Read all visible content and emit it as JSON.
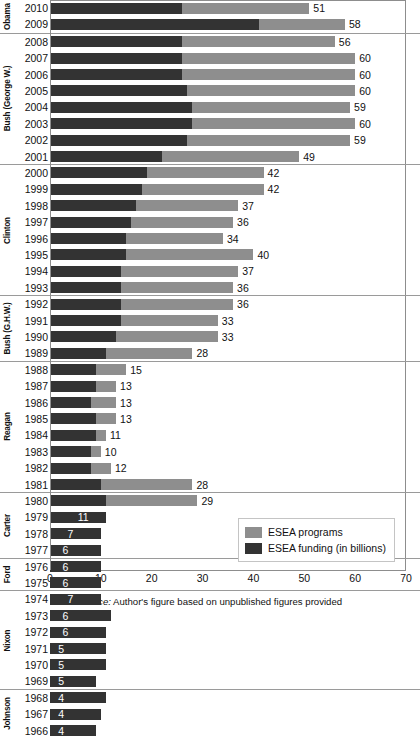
{
  "chart_data": {
    "type": "bar",
    "orientation": "horizontal",
    "stacked_overlay": true,
    "title": "",
    "xlabel": "",
    "ylabel": "",
    "xlim": [
      0,
      70
    ],
    "xticks": [
      0,
      10,
      20,
      30,
      40,
      50,
      60,
      70
    ],
    "grid": false,
    "legend_position": "bottom-right",
    "legend": [
      {
        "key": "programs",
        "label": "ESEA programs",
        "color": "#8e8e8e"
      },
      {
        "key": "funding",
        "label": "ESEA funding (in billions)",
        "color": "#333333"
      }
    ],
    "series": [
      {
        "name": "ESEA programs",
        "key": "programs",
        "color": "#8e8e8e"
      },
      {
        "name": "ESEA funding (in billions)",
        "key": "funding",
        "color": "#333333"
      }
    ],
    "groups": [
      {
        "name": "Obama",
        "rows": [
          {
            "year": "2010",
            "programs": 51,
            "funding": 26,
            "label": "51",
            "label_inside": false
          },
          {
            "year": "2009",
            "programs": 58,
            "funding": 41,
            "label": "58",
            "label_inside": false
          }
        ]
      },
      {
        "name": "Bush (George W.)",
        "rows": [
          {
            "year": "2008",
            "programs": 56,
            "funding": 26,
            "label": "56",
            "label_inside": false
          },
          {
            "year": "2007",
            "programs": 60,
            "funding": 26,
            "label": "60",
            "label_inside": false
          },
          {
            "year": "2006",
            "programs": 60,
            "funding": 26,
            "label": "60",
            "label_inside": false
          },
          {
            "year": "2005",
            "programs": 60,
            "funding": 27,
            "label": "60",
            "label_inside": false
          },
          {
            "year": "2004",
            "programs": 59,
            "funding": 28,
            "label": "59",
            "label_inside": false
          },
          {
            "year": "2003",
            "programs": 60,
            "funding": 28,
            "label": "60",
            "label_inside": false
          },
          {
            "year": "2002",
            "programs": 59,
            "funding": 27,
            "label": "59",
            "label_inside": false
          },
          {
            "year": "2001",
            "programs": 49,
            "funding": 22,
            "label": "49",
            "label_inside": false
          }
        ]
      },
      {
        "name": "Clinton",
        "rows": [
          {
            "year": "2000",
            "programs": 42,
            "funding": 19,
            "label": "42",
            "label_inside": false
          },
          {
            "year": "1999",
            "programs": 42,
            "funding": 18,
            "label": "42",
            "label_inside": false
          },
          {
            "year": "1998",
            "programs": 37,
            "funding": 17,
            "label": "37",
            "label_inside": false
          },
          {
            "year": "1997",
            "programs": 36,
            "funding": 16,
            "label": "36",
            "label_inside": false
          },
          {
            "year": "1996",
            "programs": 34,
            "funding": 15,
            "label": "34",
            "label_inside": false
          },
          {
            "year": "1995",
            "programs": 40,
            "funding": 15,
            "label": "40",
            "label_inside": false
          },
          {
            "year": "1994",
            "programs": 37,
            "funding": 14,
            "label": "37",
            "label_inside": false
          },
          {
            "year": "1993",
            "programs": 36,
            "funding": 14,
            "label": "36",
            "label_inside": false
          }
        ]
      },
      {
        "name": "Bush (G.H.W.)",
        "rows": [
          {
            "year": "1992",
            "programs": 36,
            "funding": 14,
            "label": "36",
            "label_inside": false
          },
          {
            "year": "1991",
            "programs": 33,
            "funding": 14,
            "label": "33",
            "label_inside": false
          },
          {
            "year": "1990",
            "programs": 33,
            "funding": 13,
            "label": "33",
            "label_inside": false
          },
          {
            "year": "1989",
            "programs": 28,
            "funding": 11,
            "label": "28",
            "label_inside": false
          }
        ]
      },
      {
        "name": "Reagan",
        "rows": [
          {
            "year": "1988",
            "programs": 15,
            "funding": 9,
            "label": "15",
            "label_inside": false
          },
          {
            "year": "1987",
            "programs": 13,
            "funding": 9,
            "label": "13",
            "label_inside": false
          },
          {
            "year": "1986",
            "programs": 13,
            "funding": 8,
            "label": "13",
            "label_inside": false
          },
          {
            "year": "1985",
            "programs": 13,
            "funding": 9,
            "label": "13",
            "label_inside": false
          },
          {
            "year": "1984",
            "programs": 11,
            "funding": 9,
            "label": "11",
            "label_inside": false
          },
          {
            "year": "1983",
            "programs": 10,
            "funding": 8,
            "label": "10",
            "label_inside": false
          },
          {
            "year": "1982",
            "programs": 12,
            "funding": 8,
            "label": "12",
            "label_inside": false
          },
          {
            "year": "1981",
            "programs": 28,
            "funding": 10,
            "label": "28",
            "label_inside": false
          }
        ]
      },
      {
        "name": "Carter",
        "rows": [
          {
            "year": "1980",
            "programs": 29,
            "funding": 11,
            "label": "29",
            "label_inside": false
          },
          {
            "year": "1979",
            "programs": 8,
            "funding": 11,
            "label": "11",
            "label_inside": true
          },
          {
            "year": "1978",
            "programs": 5,
            "funding": 10,
            "label": "7",
            "label_inside": true
          },
          {
            "year": "1977",
            "programs": 4,
            "funding": 10,
            "label": "6",
            "label_inside": true
          }
        ]
      },
      {
        "name": "Ford",
        "rows": [
          {
            "year": "1976",
            "programs": 4,
            "funding": 10,
            "label": "6",
            "label_inside": true
          },
          {
            "year": "1975",
            "programs": 4,
            "funding": 10,
            "label": "6",
            "label_inside": true
          }
        ]
      },
      {
        "name": "Nixon",
        "rows": [
          {
            "year": "1974",
            "programs": 5,
            "funding": 10,
            "label": "7",
            "label_inside": true
          },
          {
            "year": "1973",
            "programs": 4,
            "funding": 12,
            "label": "6",
            "label_inside": true
          },
          {
            "year": "1972",
            "programs": 4,
            "funding": 11,
            "label": "6",
            "label_inside": true
          },
          {
            "year": "1971",
            "programs": 3,
            "funding": 11,
            "label": "5",
            "label_inside": true
          },
          {
            "year": "1970",
            "programs": 3,
            "funding": 11,
            "label": "5",
            "label_inside": true
          },
          {
            "year": "1969",
            "programs": 3,
            "funding": 9,
            "label": "5",
            "label_inside": true
          }
        ]
      },
      {
        "name": "Johnson",
        "rows": [
          {
            "year": "1968",
            "programs": 2,
            "funding": 11,
            "label": "4",
            "label_inside": true
          },
          {
            "year": "1967",
            "programs": 2,
            "funding": 10,
            "label": "4",
            "label_inside": true
          },
          {
            "year": "1966",
            "programs": 2,
            "funding": 9,
            "label": "4",
            "label_inside": true
          }
        ]
      }
    ]
  },
  "source": {
    "prefix": "Source:",
    "text": " Author's figure based on unpublished figures provided"
  },
  "colors": {
    "programs": "#8e8e8e",
    "funding": "#333333",
    "axis": "#8d8d8d",
    "text": "#111111"
  }
}
